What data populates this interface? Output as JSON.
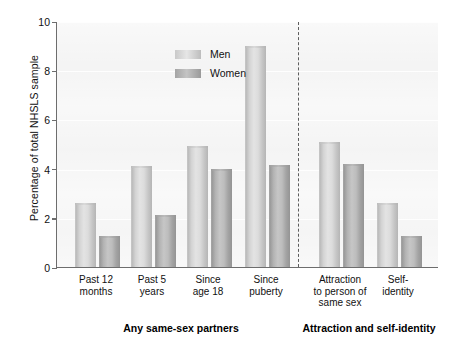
{
  "chart_data": {
    "type": "bar",
    "title": "",
    "xlabel": "",
    "ylabel": "Percentage of total NHSLS sample",
    "ylim": [
      0,
      10
    ],
    "yticks": [
      0,
      2,
      4,
      6,
      8,
      10
    ],
    "ytick_labels": [
      "0",
      "2",
      "4",
      "6",
      "8",
      "10"
    ],
    "grid": true,
    "legend_position": "top-left-inside",
    "categories": [
      "Past 12 months",
      "Past 5 years",
      "Since age 18",
      "Since puberty",
      "Attraction to person of same sex",
      "Self-identity"
    ],
    "category_lines": [
      [
        "Past 12",
        "months"
      ],
      [
        "Past 5",
        "years"
      ],
      [
        "Since",
        "age 18"
      ],
      [
        "Since",
        "puberty"
      ],
      [
        "Attraction",
        "to person of",
        "same sex"
      ],
      [
        "Self-",
        "identity"
      ]
    ],
    "series": [
      {
        "name": "Men",
        "color": "#d9d9d9",
        "values": [
          2.6,
          4.1,
          4.9,
          9.0,
          5.1,
          2.6
        ]
      },
      {
        "name": "Women",
        "color": "#aaaaaa",
        "values": [
          1.25,
          2.1,
          4.0,
          4.15,
          4.2,
          1.25
        ]
      }
    ],
    "groups": [
      {
        "label": "Any same-sex partners",
        "categories": [
          "Past 12 months",
          "Past 5 years",
          "Since age 18",
          "Since puberty"
        ]
      },
      {
        "label": "Attraction and self-identity",
        "categories": [
          "Attraction to person of same sex",
          "Self-identity"
        ]
      }
    ],
    "divider": {
      "style": "dashed",
      "after_category": "Since puberty"
    },
    "annotations": []
  },
  "legend": {
    "items": [
      {
        "label": "Men"
      },
      {
        "label": "Women"
      }
    ]
  },
  "axis": {
    "y_title": "Percentage of total NHSLS sample"
  }
}
